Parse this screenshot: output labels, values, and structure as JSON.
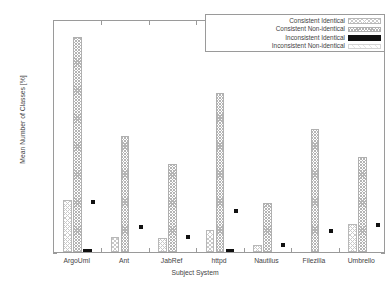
{
  "chart_data": {
    "type": "bar",
    "title": "",
    "xlabel": "Subject System",
    "ylabel": "Mean Number of Classes [%]",
    "categories": [
      "ArgoUml",
      "Ant",
      "JabRef",
      "httpd",
      "Nautilus",
      "Filezilla",
      "Umbrello"
    ],
    "ylim": [
      0,
      1800
    ],
    "yticks": [
      0,
      200,
      400,
      600,
      800,
      1000,
      1200,
      1400,
      1600,
      1800
    ],
    "grid": false,
    "legend_position": "top-right",
    "series": [
      {
        "name": "Consistent Identical",
        "pattern": "sparse-hatch",
        "values": [
          400,
          115,
          110,
          170,
          55,
          0,
          215
        ]
      },
      {
        "name": "Consistent Non-identical",
        "pattern": "dense-cross-hatch",
        "values": [
          1660,
          900,
          680,
          1230,
          375,
          950,
          735
        ]
      },
      {
        "name": "Inconsistent Identical",
        "pattern": "solid-black",
        "values": [
          25,
          0,
          0,
          22,
          0,
          0,
          0
        ]
      },
      {
        "name": "Inconsistent Non-identical",
        "pattern": "near-empty",
        "values": [
          400,
          205,
          130,
          330,
          70,
          180,
          225
        ]
      }
    ]
  },
  "axes": {
    "y_tick_labels": [
      "0",
      "200",
      "400",
      "600",
      "800",
      "1000",
      "1200",
      "1400",
      "1600",
      "1800"
    ],
    "y_axis_title": "Mean Number of Classes [%]",
    "x_axis_title": "Subject System",
    "x_tick_labels": [
      "ArgoUml",
      "Ant",
      "JabRef",
      "httpd",
      "Nautilus",
      "Filezilla",
      "Umbrello"
    ]
  },
  "legend": {
    "entries": [
      {
        "label": "Consistent Identical",
        "swatch": "sparse-hatch-swatch"
      },
      {
        "label": "Consistent Non-identical",
        "swatch": "dense-cross-hatch-swatch"
      },
      {
        "label": "Inconsistent Identical",
        "swatch": "solid-black-swatch"
      },
      {
        "label": "Inconsistent Non-identical",
        "swatch": "near-empty-swatch"
      }
    ]
  },
  "colors": {
    "background": "#ffffff",
    "frame": "#9a9a9a",
    "text": "#444444",
    "solid_series": "#111111"
  }
}
